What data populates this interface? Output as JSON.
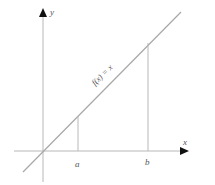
{
  "diagram": {
    "axes": {
      "x_label": "x",
      "y_label": "y"
    },
    "function_label": "f(x) = x",
    "markers": [
      {
        "label": "a"
      },
      {
        "label": "b"
      }
    ],
    "colors": {
      "axis": "#b0b0b0",
      "line": "#a8a8a8",
      "text": "#555555",
      "arrow": "#111111"
    }
  }
}
